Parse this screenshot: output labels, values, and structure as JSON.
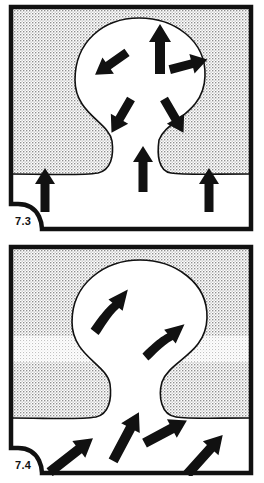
{
  "sheet": {
    "background_color": "#ffffff",
    "ink_color": "#111111",
    "stipple_color": "#9a9a9a",
    "stipple_background": "#ffffff"
  },
  "panels": [
    {
      "id": "panel-73",
      "label": "7.3",
      "caption_corner": "bottom-left",
      "border_color": "#111111",
      "fill_stipple": true,
      "body_fill": "#ffffff",
      "description": "Mushroom-shaped diapir rising through stippled host rock; radial arrows inside the bulb and vertical arrows in the clear basal layer.",
      "arrows": [
        {
          "name": "arrow-bulb-up",
          "direction": "up",
          "style": "straight",
          "x": 152,
          "y": 40,
          "angle": 0,
          "length": 30,
          "width": 11
        },
        {
          "name": "arrow-bulb-upleft",
          "direction": "up-left",
          "style": "straight",
          "x": 101,
          "y": 61,
          "angle": -125,
          "length": 24,
          "width": 10
        },
        {
          "name": "arrow-bulb-right",
          "direction": "right",
          "style": "straight",
          "x": 183,
          "y": 60,
          "angle": 75,
          "length": 24,
          "width": 10
        },
        {
          "name": "arrow-bulb-downleft",
          "direction": "down-left",
          "style": "straight",
          "x": 112,
          "y": 114,
          "angle": -150,
          "length": 24,
          "width": 10
        },
        {
          "name": "arrow-bulb-downright",
          "direction": "down-right",
          "style": "straight",
          "x": 167,
          "y": 114,
          "angle": 150,
          "length": 24,
          "width": 10
        },
        {
          "name": "arrow-stem-up",
          "direction": "up",
          "style": "straight",
          "x": 135,
          "y": 160,
          "angle": 0,
          "length": 30,
          "width": 10
        },
        {
          "name": "arrow-base-left-up",
          "direction": "up",
          "style": "straight",
          "x": 37,
          "y": 182,
          "angle": 0,
          "length": 28,
          "width": 10
        },
        {
          "name": "arrow-base-right-up",
          "direction": "up",
          "style": "straight",
          "x": 201,
          "y": 182,
          "angle": 0,
          "length": 28,
          "width": 10
        }
      ]
    },
    {
      "id": "panel-74",
      "label": "7.4",
      "caption_corner": "bottom-left",
      "border_color": "#111111",
      "fill_stipple": true,
      "body_fill": "#ffffff",
      "description": "Same diapir with obliquely-inclined flow arrows; a lighter stippled marker band crosses the host rock at mid height.",
      "marker_band": {
        "name": "marker-band",
        "y": 92,
        "height": 26,
        "tone": "light"
      },
      "arrows": [
        {
          "name": "arrow-bulb-upright-1",
          "direction": "up-right",
          "style": "bent",
          "x": 110,
          "y": 58,
          "angle": 38,
          "length": 40,
          "width": 11
        },
        {
          "name": "arrow-bulb-upright-2",
          "direction": "up-right",
          "style": "bent",
          "x": 165,
          "y": 90,
          "angle": 50,
          "length": 38,
          "width": 10
        },
        {
          "name": "arrow-neck-upright",
          "direction": "up-right",
          "style": "straight",
          "x": 122,
          "y": 185,
          "angle": 28,
          "length": 36,
          "width": 11
        },
        {
          "name": "arrow-neck-right",
          "direction": "up-right",
          "style": "straight",
          "x": 163,
          "y": 185,
          "angle": 62,
          "length": 30,
          "width": 11
        },
        {
          "name": "arrow-base-left",
          "direction": "up-right",
          "style": "straight",
          "x": 70,
          "y": 206,
          "angle": 52,
          "length": 36,
          "width": 11
        },
        {
          "name": "arrow-base-right",
          "direction": "up-right",
          "style": "straight",
          "x": 202,
          "y": 205,
          "angle": 42,
          "length": 34,
          "width": 11
        }
      ]
    }
  ]
}
